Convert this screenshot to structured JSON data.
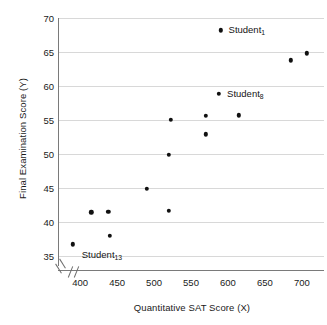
{
  "chart_data": {
    "type": "scatter",
    "title": "",
    "xlabel": "Quantitative SAT Score (X)",
    "ylabel": "Final Examination Score (Y)",
    "xlim": [
      370,
      730
    ],
    "ylim": [
      33.5,
      70
    ],
    "xticks": [
      400,
      450,
      500,
      550,
      600,
      650,
      700
    ],
    "yticks": [
      35,
      40,
      45,
      50,
      55,
      60,
      65,
      70
    ],
    "grid": true,
    "legend": "none",
    "axis_break": {
      "x": true,
      "y": true
    },
    "marker_color": "#111111",
    "gridline_color": "#d8d8d8",
    "axis_color": "#7a7a7a",
    "points": [
      {
        "x": 590,
        "y": 68.2,
        "label": "Student",
        "sub": "1",
        "label_dx": 8,
        "label_dy": 0
      },
      {
        "x": 685,
        "y": 63.8,
        "label": "",
        "sub": ""
      },
      {
        "x": 707,
        "y": 64.8,
        "label": "",
        "sub": ""
      },
      {
        "x": 588,
        "y": 58.8,
        "label": "Student",
        "sub": "8",
        "label_dx": 8,
        "label_dy": 0
      },
      {
        "x": 523,
        "y": 55.0,
        "label": "",
        "sub": ""
      },
      {
        "x": 570,
        "y": 55.6,
        "label": "",
        "sub": ""
      },
      {
        "x": 615,
        "y": 55.7,
        "label": "",
        "sub": ""
      },
      {
        "x": 570,
        "y": 52.9,
        "label": "",
        "sub": ""
      },
      {
        "x": 520,
        "y": 49.9,
        "label": "",
        "sub": ""
      },
      {
        "x": 490,
        "y": 44.9,
        "label": "",
        "sub": ""
      },
      {
        "x": 415,
        "y": 41.4,
        "label": "",
        "sub": ""
      },
      {
        "x": 438,
        "y": 41.5,
        "label": "",
        "sub": ""
      },
      {
        "x": 520,
        "y": 41.6,
        "label": "",
        "sub": ""
      },
      {
        "x": 440,
        "y": 37.9,
        "label": "",
        "sub": ""
      },
      {
        "x": 390,
        "y": 36.7,
        "label": "Student",
        "sub": "13",
        "label_dx": 9,
        "label_dy": 11
      }
    ]
  }
}
